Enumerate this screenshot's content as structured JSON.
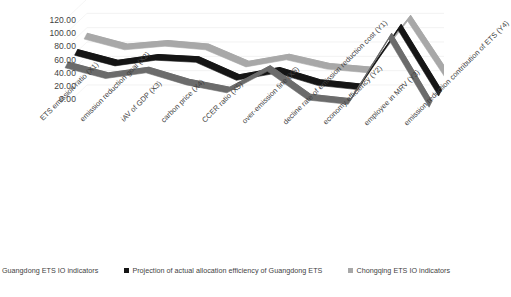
{
  "chart_data": {
    "type": "line",
    "title": "",
    "xlabel": "",
    "ylabel": "",
    "ylim": [
      0,
      120
    ],
    "grid": true,
    "three_d": true,
    "legend_position": "bottom",
    "y_ticks": [
      "0.00",
      "20.00",
      "40.00",
      "60.00",
      "80.00",
      "100.00",
      "120.00"
    ],
    "categories": [
      "ETS emission ratio  (X1)",
      "emission reduction goal  (X2)",
      "iAV of GDP  (X3)",
      "carbon price  (X4)",
      "CCER ratio  (X5)",
      "over-emission fine  (X6)",
      "decline rate of emission reduction cost  (Y1)",
      "economy efficiency  (Y2)",
      "employee in MRV  (Y3)",
      "emission reduction contribution of ETS  (Y4)"
    ],
    "series": [
      {
        "name": "Guangdong ETS IO indicators",
        "color": "#6b6b6b",
        "values": [
          57,
          42,
          50,
          33,
          22,
          52,
          12,
          6,
          97,
          2
        ]
      },
      {
        "name": "Projection of actual allocation efficiency of Guangdong ETS",
        "color": "#151515",
        "values": [
          62,
          47,
          55,
          52,
          27,
          37,
          20,
          14,
          97,
          5
        ]
      },
      {
        "name": "Chongqing ETS IO indicators",
        "color": "#a8a8a8",
        "values": [
          72,
          57,
          62,
          57,
          33,
          43,
          30,
          25,
          97,
          12
        ]
      }
    ]
  }
}
